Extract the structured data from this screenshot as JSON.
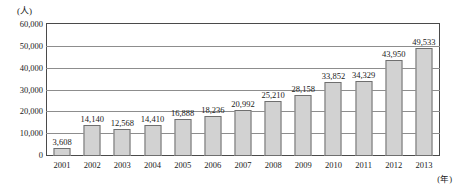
{
  "chart_data": {
    "type": "bar",
    "title": "",
    "xlabel": "(年)",
    "ylabel": "(人)",
    "categories": [
      "2001",
      "2002",
      "2003",
      "2004",
      "2005",
      "2006",
      "2007",
      "2008",
      "2009",
      "2010",
      "2011",
      "2012",
      "2013"
    ],
    "values": [
      3608,
      14140,
      12568,
      14410,
      16888,
      18236,
      20992,
      25210,
      28158,
      33852,
      34329,
      43950,
      49533
    ],
    "value_labels": [
      "3,608",
      "14,140",
      "12,568",
      "14,410",
      "16,888",
      "18,236",
      "20,992",
      "25,210",
      "28,158",
      "33,852",
      "34,329",
      "43,950",
      "49,533"
    ],
    "ylim": [
      0,
      60000
    ],
    "yticks": [
      0,
      10000,
      20000,
      30000,
      40000,
      50000,
      60000
    ],
    "ytick_labels": [
      "0",
      "10,000",
      "20,000",
      "30,000",
      "40,000",
      "50,000",
      "60,000"
    ],
    "grid": true,
    "legend": "none",
    "bar_fill": "#d2d2d2",
    "bar_stroke": "#6f6f6f",
    "grid_color": "#8d8d8d",
    "frame_color": "#4a4a4a"
  }
}
